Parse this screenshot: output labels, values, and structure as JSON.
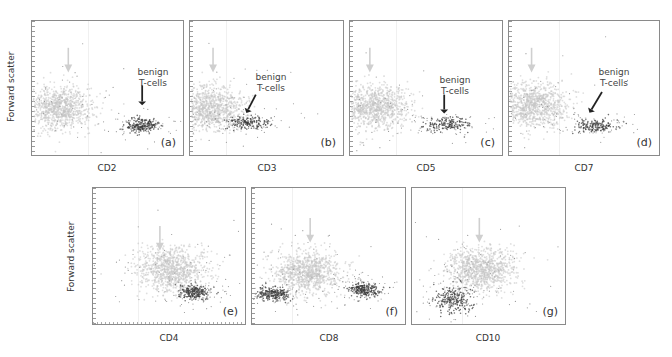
{
  "figure": {
    "y_axis_label": "Forward scatter",
    "annotation": "benign\nT-cells",
    "annotation_lines": [
      "benign",
      "T-cells"
    ],
    "colors": {
      "tumor_population": "#c8c8c8",
      "benign_tcells": "#3a3a3a",
      "light_arrow": "#cfcfcf",
      "dark_arrow": "#222222",
      "frame": "#8a8a8a"
    },
    "panels": [
      {
        "letter": "(a)",
        "marker": "CD2",
        "row": 1,
        "has_annotation": true
      },
      {
        "letter": "(b)",
        "marker": "CD3",
        "row": 1,
        "has_annotation": true
      },
      {
        "letter": "(c)",
        "marker": "CD5",
        "row": 1,
        "has_annotation": true
      },
      {
        "letter": "(d)",
        "marker": "CD7",
        "row": 1,
        "has_annotation": true
      },
      {
        "letter": "(e)",
        "marker": "CD4",
        "row": 2,
        "has_annotation": false
      },
      {
        "letter": "(f)",
        "marker": "CD8",
        "row": 2,
        "has_annotation": false
      },
      {
        "letter": "(g)",
        "marker": "CD10",
        "row": 2,
        "has_annotation": false
      }
    ]
  },
  "chart_data": [
    {
      "type": "scatter",
      "title": "(a)",
      "xlabel": "CD2",
      "ylabel": "Forward scatter",
      "populations": [
        {
          "name": "tumor cells (CD2 negative)",
          "x_center": 0.18,
          "y_center": 0.35,
          "shade": "light"
        },
        {
          "name": "benign T-cells",
          "x_center": 0.73,
          "y_center": 0.22,
          "shade": "dark"
        }
      ]
    },
    {
      "type": "scatter",
      "title": "(b)",
      "xlabel": "CD3",
      "ylabel": "Forward scatter",
      "populations": [
        {
          "name": "tumor cells (CD3 negative)",
          "x_center": 0.13,
          "y_center": 0.35,
          "shade": "light"
        },
        {
          "name": "benign T-cells",
          "x_center": 0.37,
          "y_center": 0.24,
          "shade": "dark"
        }
      ]
    },
    {
      "type": "scatter",
      "title": "(c)",
      "xlabel": "CD5",
      "ylabel": "Forward scatter",
      "populations": [
        {
          "name": "tumor cells (CD5 negative)",
          "x_center": 0.16,
          "y_center": 0.36,
          "shade": "light"
        },
        {
          "name": "benign T-cells",
          "x_center": 0.63,
          "y_center": 0.23,
          "shade": "dark"
        }
      ]
    },
    {
      "type": "scatter",
      "title": "(d)",
      "xlabel": "CD7",
      "ylabel": "Forward scatter",
      "populations": [
        {
          "name": "tumor cells (CD7 negative)",
          "x_center": 0.17,
          "y_center": 0.37,
          "shade": "light"
        },
        {
          "name": "benign T-cells",
          "x_center": 0.58,
          "y_center": 0.22,
          "shade": "dark"
        }
      ]
    },
    {
      "type": "scatter",
      "title": "(e)",
      "xlabel": "CD4",
      "ylabel": "Forward scatter",
      "populations": [
        {
          "name": "tumor cells (CD4 positive)",
          "x_center": 0.52,
          "y_center": 0.4,
          "shade": "light"
        },
        {
          "name": "benign cells",
          "x_center": 0.67,
          "y_center": 0.23,
          "shade": "dark"
        }
      ]
    },
    {
      "type": "scatter",
      "title": "(f)",
      "xlabel": "CD8",
      "ylabel": "Forward scatter",
      "populations": [
        {
          "name": "tumor cells",
          "x_center": 0.35,
          "y_center": 0.38,
          "shade": "light"
        },
        {
          "name": "benign cells",
          "x_center": 0.14,
          "y_center": 0.22,
          "shade": "dark"
        },
        {
          "name": "CD8+ cells",
          "x_center": 0.73,
          "y_center": 0.25,
          "shade": "dark"
        }
      ]
    },
    {
      "type": "scatter",
      "title": "(g)",
      "xlabel": "CD10",
      "ylabel": "Forward scatter",
      "populations": [
        {
          "name": "tumor cells",
          "x_center": 0.45,
          "y_center": 0.4,
          "shade": "light"
        },
        {
          "name": "benign cells",
          "x_center": 0.27,
          "y_center": 0.18,
          "shade": "dark"
        }
      ]
    }
  ]
}
